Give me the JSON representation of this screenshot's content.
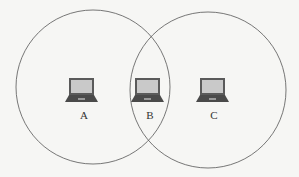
{
  "diagram": {
    "colors": {
      "background": "#f6f6f4",
      "circle_stroke": "#555555",
      "laptop_body": "#555555",
      "laptop_screen": "#c8c8c8"
    },
    "ranges": [
      {
        "name": "range-of-A",
        "cx": 93,
        "cy": 87,
        "r": 77
      },
      {
        "name": "range-of-C",
        "cx": 208,
        "cy": 90,
        "r": 78
      }
    ],
    "nodes": [
      {
        "label": "A",
        "x": 88,
        "y": 78
      },
      {
        "label": "B",
        "x": 148,
        "y": 78
      },
      {
        "label": "C",
        "x": 208,
        "y": 78
      }
    ]
  }
}
